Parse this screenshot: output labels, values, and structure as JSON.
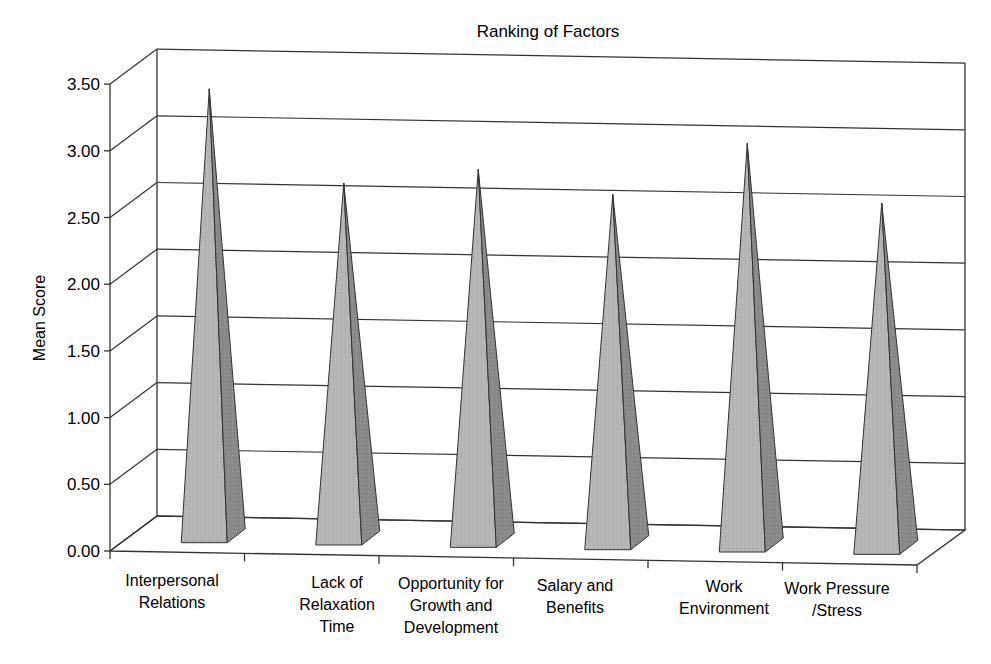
{
  "chart_data": {
    "type": "bar",
    "subtype": "3d-pyramid",
    "title": "Ranking of Factors",
    "xlabel": "",
    "ylabel": "Mean Score",
    "ylim": [
      0,
      3.5
    ],
    "yticks": [
      "0.00",
      "0.50",
      "1.00",
      "1.50",
      "2.00",
      "2.50",
      "3.00",
      "3.50"
    ],
    "categories": [
      "Interpersonal Relations",
      "Lack of Relaxation Time",
      "Opportunity for Growth and Development",
      "Salary and Benefits",
      "Work Environment",
      "Work Pressure /Stress"
    ],
    "category_lines": [
      [
        "Interpersonal",
        "Relations"
      ],
      [
        "Lack of",
        "Relaxation",
        "Time"
      ],
      [
        "Opportunity for",
        "Growth and",
        "Development"
      ],
      [
        "Salary and",
        "Benefits"
      ],
      [
        "Work",
        "Environment"
      ],
      [
        "Work Pressure",
        "/Stress"
      ]
    ],
    "values": [
      3.35,
      2.66,
      2.78,
      2.61,
      3.01,
      2.58
    ],
    "grid": true,
    "legend": "none",
    "colors": {
      "front_face": "#b5b5b5",
      "side_face": "#8a8a8a",
      "lines": "#333333"
    }
  }
}
